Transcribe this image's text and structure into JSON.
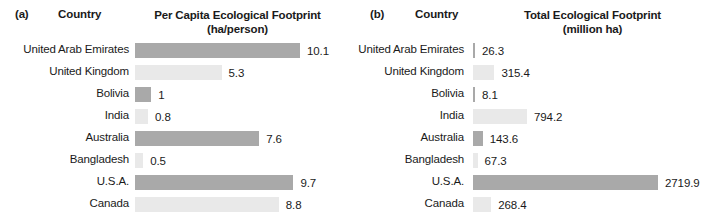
{
  "figure": {
    "panels": [
      {
        "tag": "(a)",
        "country_header": "Country",
        "metric_header": "Per Capita Ecological Footprint",
        "unit_header": "(ha/person)"
      },
      {
        "tag": "(b)",
        "country_header": "Country",
        "metric_header": "Total Ecological Footprint",
        "unit_header": "(million ha)"
      }
    ]
  },
  "colors": {
    "bar_dark": "#a9a9a9",
    "bar_light": "#e9e9e9",
    "text": "#1a1a1a",
    "background": "#ffffff"
  },
  "chart_data": [
    {
      "type": "bar",
      "title": "Per Capita Ecological Footprint",
      "subtitle": "(ha/person)",
      "panel": "(a)",
      "orientation": "horizontal",
      "xlabel": "",
      "ylabel": "Country",
      "grid": false,
      "legend": "none",
      "xlim": [
        0,
        10.1
      ],
      "categories": [
        "United Arab Emirates",
        "United Kingdom",
        "Bolivia",
        "India",
        "Australia",
        "Bangladesh",
        "U.S.A.",
        "Canada"
      ],
      "values": [
        10.1,
        5.3,
        1,
        0.8,
        7.6,
        0.5,
        9.7,
        8.8
      ],
      "value_labels": [
        "10.1",
        "5.3",
        "1",
        "0.8",
        "7.6",
        "0.5",
        "9.7",
        "8.8"
      ],
      "bar_shades": [
        "dark",
        "light",
        "dark",
        "light",
        "dark",
        "light",
        "dark",
        "light"
      ]
    },
    {
      "type": "bar",
      "title": "Total Ecological Footprint",
      "subtitle": "(million ha)",
      "panel": "(b)",
      "orientation": "horizontal",
      "xlabel": "",
      "ylabel": "Country",
      "grid": false,
      "legend": "none",
      "xlim": [
        0,
        2719.9
      ],
      "categories": [
        "United Arab Emirates",
        "United Kingdom",
        "Bolivia",
        "India",
        "Australia",
        "Bangladesh",
        "U.S.A.",
        "Canada"
      ],
      "values": [
        26.3,
        315.4,
        8.1,
        794.2,
        143.6,
        67.3,
        2719.9,
        268.4
      ],
      "value_labels": [
        "26.3",
        "315.4",
        "8.1",
        "794.2",
        "143.6",
        "67.3",
        "2719.9",
        "268.4"
      ],
      "bar_shades": [
        "dark",
        "light",
        "dark",
        "light",
        "dark",
        "light",
        "dark",
        "light"
      ]
    }
  ]
}
